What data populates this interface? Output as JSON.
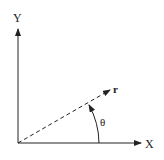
{
  "diagram": {
    "title": "",
    "labels": {
      "y_axis": "Y",
      "x_axis": "X",
      "radius": "r",
      "angle": "θ"
    },
    "colors": {
      "stroke": "#222222",
      "background": "#ffffff"
    },
    "elements": [
      {
        "type": "axis",
        "name": "y-axis",
        "from": [
          18,
          143
        ],
        "to": [
          18,
          27
        ]
      },
      {
        "type": "axis",
        "name": "x-axis",
        "from": [
          18,
          143
        ],
        "to": [
          140,
          143
        ]
      },
      {
        "type": "dashed-vector",
        "name": "r-vector",
        "from": [
          18,
          143
        ],
        "to": [
          110,
          90
        ]
      },
      {
        "type": "arc",
        "name": "theta-arc",
        "from": [
          99,
          143
        ],
        "to": [
          90,
          104
        ]
      }
    ]
  }
}
